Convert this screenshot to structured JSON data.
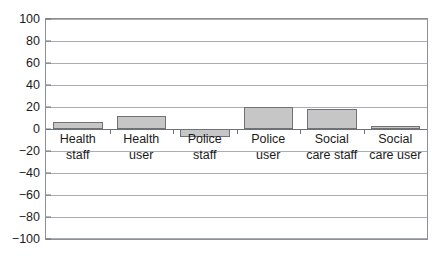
{
  "chart_data": {
    "type": "bar",
    "title": "",
    "subtitle": "",
    "xlabel": "",
    "ylabel": "",
    "ylim": [
      -100,
      100
    ],
    "ytick_step": 20,
    "yticks": [
      100,
      80,
      60,
      40,
      20,
      0,
      -20,
      -40,
      -60,
      -80,
      -100
    ],
    "ytick_labels": [
      "100",
      "80",
      "60",
      "40",
      "20",
      "0",
      "−20",
      "−40",
      "−60",
      "−80",
      "−100"
    ],
    "categories": [
      "Health staff",
      "Health user",
      "Police staff",
      "Police user",
      "Social care staff",
      "Social care user"
    ],
    "category_lines": [
      [
        "Health",
        "staff"
      ],
      [
        "Health",
        "user"
      ],
      [
        "Police",
        "staff"
      ],
      [
        "Police",
        "user"
      ],
      [
        "Social",
        "care staff"
      ],
      [
        "Social",
        "care user"
      ]
    ],
    "values": [
      6,
      12,
      -7,
      20,
      18,
      3
    ],
    "grid": true,
    "legend": false,
    "legend_position": "none",
    "bar_fill_color": "#c6c6c6",
    "bar_border_color": "#6f7276",
    "gridline_color": "#a9acb2",
    "axis_color": "#6e7277",
    "frame_color": "#8d9096",
    "background_color": "#ffffff",
    "text_color": "#1b1b1b"
  }
}
